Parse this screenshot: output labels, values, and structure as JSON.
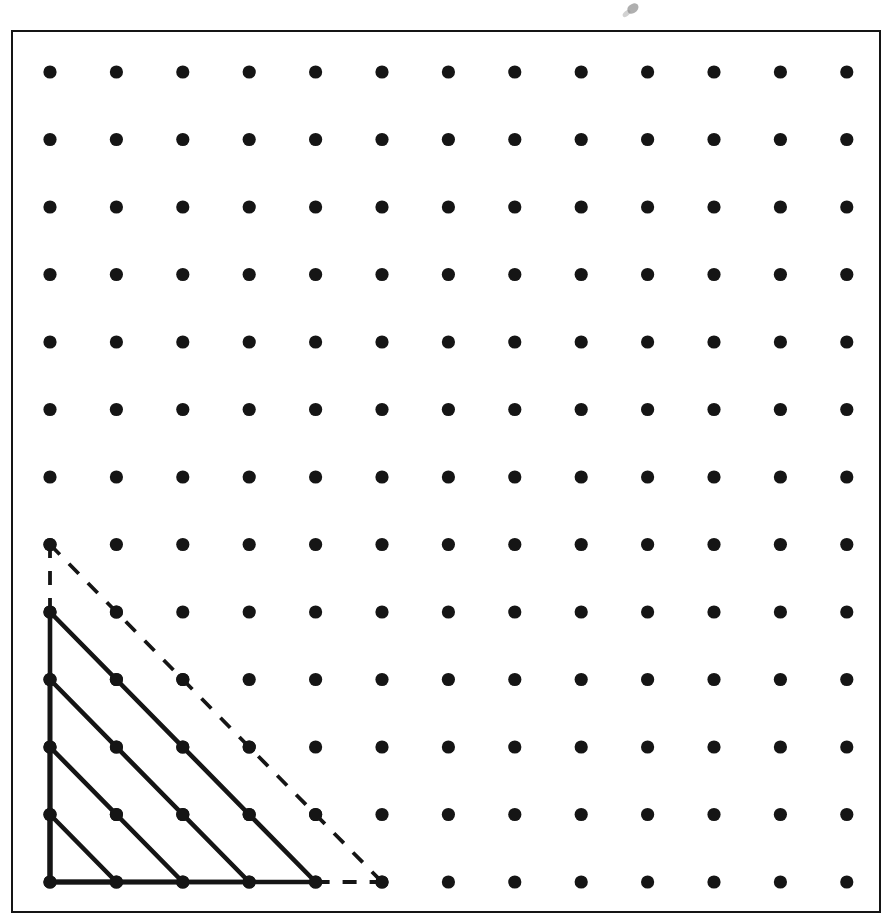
{
  "figure": {
    "kind": "dot-lattice-geoboard",
    "title": "",
    "caption": "",
    "frame": {
      "border_color": "#151515",
      "border_width_px": 2.5,
      "background": "#ffffff",
      "left_px": 11,
      "top_px": 30,
      "width_px": 870,
      "height_px": 883
    }
  },
  "chart_data": {
    "type": "scatter",
    "title": "",
    "subtitle": "",
    "xlabel": "",
    "ylabel": "",
    "grid": false,
    "legend_position": "none",
    "xlim": [
      0,
      12
    ],
    "ylim": [
      0,
      12
    ],
    "xticks": [],
    "yticks": [],
    "lattice": {
      "columns": 13,
      "rows": 13,
      "origin_px": {
        "x": 50,
        "y": 882
      },
      "spacing_px": {
        "x": 66.4,
        "y": 67.5
      },
      "dot_radius_px": 6.6,
      "dot_color": "#151515",
      "point_count": 169
    },
    "series": [
      {
        "name": "lattice-points",
        "marker": "filled-circle",
        "color": "#151515",
        "x": [
          0,
          1,
          2,
          3,
          4,
          5,
          6,
          7,
          8,
          9,
          10,
          11,
          12
        ],
        "y": [
          0,
          1,
          2,
          3,
          4,
          5,
          6,
          7,
          8,
          9,
          10,
          11,
          12
        ]
      }
    ],
    "shapes": [
      {
        "name": "triangle-leg-1",
        "type": "right-triangle",
        "style": "solid",
        "color": "#151515",
        "line_width_px": 4.6,
        "leg_length": 1,
        "area_square_units": 0.5,
        "vertices": [
          [
            0,
            0
          ],
          [
            0,
            1
          ],
          [
            1,
            0
          ]
        ]
      },
      {
        "name": "triangle-leg-2",
        "type": "right-triangle",
        "style": "solid",
        "color": "#151515",
        "line_width_px": 4.6,
        "leg_length": 2,
        "area_square_units": 2,
        "vertices": [
          [
            0,
            0
          ],
          [
            0,
            2
          ],
          [
            2,
            0
          ]
        ]
      },
      {
        "name": "triangle-leg-3",
        "type": "right-triangle",
        "style": "solid",
        "color": "#151515",
        "line_width_px": 4.6,
        "leg_length": 3,
        "area_square_units": 4.5,
        "vertices": [
          [
            0,
            0
          ],
          [
            0,
            3
          ],
          [
            3,
            0
          ]
        ]
      },
      {
        "name": "triangle-leg-4",
        "type": "right-triangle",
        "style": "solid",
        "color": "#151515",
        "line_width_px": 4.6,
        "leg_length": 4,
        "area_square_units": 8,
        "vertices": [
          [
            0,
            0
          ],
          [
            0,
            4
          ],
          [
            4,
            0
          ]
        ]
      },
      {
        "name": "triangle-leg-5-dashed",
        "type": "right-triangle",
        "style": "dashed",
        "color": "#151515",
        "line_width_px": 3.8,
        "dash_pattern_px": [
          14,
          13
        ],
        "leg_length": 5,
        "area_square_units": 12.5,
        "vertices": [
          [
            0,
            0
          ],
          [
            0,
            5
          ],
          [
            5,
            0
          ]
        ],
        "dashed_segments": [
          {
            "from": [
              0,
              4
            ],
            "to": [
              0,
              5
            ]
          },
          {
            "from": [
              0,
              5
            ],
            "to": [
              5,
              0
            ]
          },
          {
            "from": [
              4,
              0
            ],
            "to": [
              5,
              0
            ]
          }
        ]
      }
    ]
  },
  "artifacts": {
    "smudge_label": "scan-artifact-top"
  }
}
